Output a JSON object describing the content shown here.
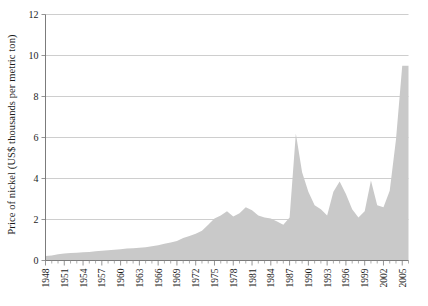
{
  "chart_data": {
    "type": "area",
    "title": "",
    "xlabel": "",
    "ylabel": "Price of nickel (US$ thousands per metric ton)",
    "ylim": [
      0,
      12
    ],
    "xlim": [
      1948,
      2006
    ],
    "yticks": [
      0,
      2,
      4,
      6,
      8,
      10,
      12
    ],
    "ytick_labels": [
      "0",
      "2",
      "4",
      "6",
      "8",
      "10",
      "12"
    ],
    "xticks": [
      1948,
      1951,
      1954,
      1957,
      1960,
      1963,
      1966,
      1969,
      1972,
      1975,
      1978,
      1981,
      1984,
      1987,
      1990,
      1993,
      1996,
      1999,
      2002,
      2005
    ],
    "xtick_labels": [
      "1948",
      "1951",
      "1954",
      "1957",
      "1960",
      "1963",
      "1966",
      "1969",
      "1972",
      "1975",
      "1978",
      "1981",
      "1984",
      "1987",
      "1990",
      "1993",
      "1996",
      "1999",
      "2002",
      "2005"
    ],
    "grid": true,
    "legend": null,
    "series_name": "Price of nickel",
    "fill_color": "#c9c9c9",
    "x": [
      1948,
      1949,
      1950,
      1951,
      1952,
      1953,
      1954,
      1955,
      1956,
      1957,
      1958,
      1959,
      1960,
      1961,
      1962,
      1963,
      1964,
      1965,
      1966,
      1967,
      1968,
      1969,
      1970,
      1971,
      1972,
      1973,
      1974,
      1975,
      1976,
      1977,
      1978,
      1979,
      1980,
      1981,
      1982,
      1983,
      1984,
      1985,
      1986,
      1987,
      1988,
      1989,
      1990,
      1991,
      1992,
      1993,
      1994,
      1995,
      1996,
      1997,
      1998,
      1999,
      2000,
      2001,
      2002,
      2003,
      2004,
      2005,
      2006
    ],
    "values": [
      0.22,
      0.25,
      0.3,
      0.34,
      0.36,
      0.38,
      0.4,
      0.42,
      0.45,
      0.48,
      0.5,
      0.52,
      0.55,
      0.58,
      0.6,
      0.62,
      0.65,
      0.7,
      0.75,
      0.82,
      0.88,
      0.95,
      1.1,
      1.2,
      1.3,
      1.45,
      1.75,
      2.05,
      2.2,
      2.4,
      2.15,
      2.3,
      2.6,
      2.45,
      2.2,
      2.1,
      2.05,
      1.9,
      1.75,
      2.1,
      6.2,
      4.3,
      3.35,
      2.7,
      2.5,
      2.2,
      3.35,
      3.85,
      3.25,
      2.5,
      2.1,
      2.4,
      3.9,
      2.7,
      2.6,
      3.4,
      5.9,
      9.5,
      9.5
    ],
    "notes": [
      "Sharp spike in 1988 to about 6.2",
      "Peak at the right edge in 2005 near 9.5"
    ]
  },
  "axes": {
    "y_axis_name": "y-axis",
    "x_axis_name": "x-axis"
  }
}
